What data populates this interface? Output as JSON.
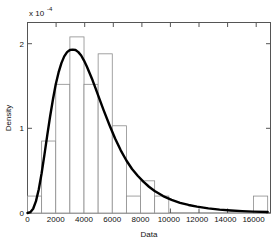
{
  "chart_data": {
    "type": "bar",
    "title": "",
    "subtitle": "",
    "xlabel": "Data",
    "ylabel": "Density",
    "y_exponent_mantissa": "x 10",
    "y_exponent_power": "-4",
    "xlim": [
      0,
      17200
    ],
    "ylim": [
      0,
      2.25
    ],
    "grid": false,
    "legend": null,
    "x_ticks": [
      0,
      2000,
      4000,
      6000,
      8000,
      10000,
      12000,
      14000,
      16000
    ],
    "x_tick_labels": [
      "0",
      "2000",
      "4000",
      "6000",
      "8000",
      "10000",
      "12000",
      "14000",
      "16000"
    ],
    "y_ticks": [
      0,
      1,
      2
    ],
    "y_tick_labels": [
      "0",
      "1",
      "2"
    ],
    "bin_width": 1000,
    "bin_edges": [
      0,
      1000,
      2000,
      3000,
      4000,
      5000,
      6000,
      7000,
      8000,
      9000,
      10000,
      11000,
      12000,
      13000,
      14000,
      15000,
      16000,
      17000
    ],
    "categories": [
      "0-1000",
      "1000-2000",
      "2000-3000",
      "3000-4000",
      "4000-5000",
      "5000-6000",
      "6000-7000",
      "7000-8000",
      "8000-9000",
      "9000-10000",
      "10000-11000",
      "11000-12000",
      "12000-13000",
      "13000-14000",
      "14000-15000",
      "15000-16000",
      "16000-17000"
    ],
    "series": [
      {
        "name": "Histogram",
        "kind": "bar",
        "values": [
          0.2,
          0.85,
          1.52,
          2.08,
          1.52,
          1.88,
          1.03,
          0.2,
          0.38,
          0.2,
          0,
          0,
          0,
          0,
          0,
          0,
          0.2
        ]
      },
      {
        "name": "Fitted density curve",
        "kind": "line",
        "x": [
          0,
          200,
          400,
          600,
          800,
          1000,
          1200,
          1400,
          1600,
          1800,
          2000,
          2200,
          2400,
          2600,
          2800,
          3000,
          3200,
          3400,
          3600,
          3800,
          4000,
          4200,
          4400,
          4600,
          4800,
          5000,
          5400,
          5800,
          6200,
          6600,
          7000,
          7400,
          7800,
          8200,
          8600,
          9000,
          9600,
          10200,
          10800,
          11400,
          12000,
          12800,
          13600,
          14400,
          15200,
          16000,
          17000
        ],
        "values": [
          0.0,
          0.01,
          0.05,
          0.14,
          0.28,
          0.47,
          0.69,
          0.92,
          1.14,
          1.34,
          1.52,
          1.66,
          1.77,
          1.85,
          1.9,
          1.925,
          1.93,
          1.925,
          1.9,
          1.86,
          1.8,
          1.73,
          1.65,
          1.57,
          1.48,
          1.39,
          1.21,
          1.04,
          0.88,
          0.74,
          0.62,
          0.52,
          0.44,
          0.37,
          0.31,
          0.26,
          0.2,
          0.155,
          0.12,
          0.095,
          0.075,
          0.055,
          0.04,
          0.03,
          0.022,
          0.016,
          0.011
        ]
      }
    ],
    "colors": {
      "bar_edge": "#8c8c8c",
      "bar_fill": "#ffffff",
      "curve": "#000000",
      "axis": "#4d4d4d",
      "text": "#111111",
      "background": "#ffffff"
    }
  }
}
